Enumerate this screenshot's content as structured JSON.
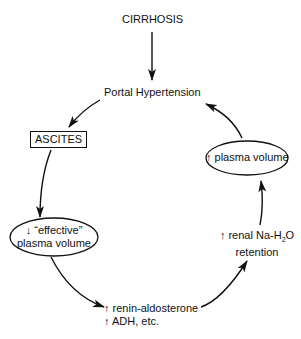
{
  "diagram": {
    "top": {
      "label": "CIRRHOSIS"
    },
    "nodes": {
      "portal_hypertension": "Portal Hypertension",
      "ascites": "ASCITES",
      "effective_plasma_volume": {
        "line1": "↓ “effective”",
        "line2": "plasma volume"
      },
      "renin": {
        "line1": "↑ renin-aldosterone",
        "line2": "↑ ADH, etc."
      },
      "renal_retention": {
        "line1_prefix": "↑ renal Na-H",
        "line1_sub": "2",
        "line1_suffix": "O",
        "line2": "retention"
      },
      "plasma_volume_up": "↑ plasma volume"
    },
    "edges": [
      {
        "from": "CIRRHOSIS",
        "to": "Portal Hypertension"
      },
      {
        "from": "Portal Hypertension",
        "to": "ASCITES"
      },
      {
        "from": "ASCITES",
        "to": "↓ effective plasma volume"
      },
      {
        "from": "↓ effective plasma volume",
        "to": "↑ renin-aldosterone / ↑ ADH, etc."
      },
      {
        "from": "↑ renin-aldosterone / ↑ ADH, etc.",
        "to": "↑ renal Na-H2O retention"
      },
      {
        "from": "↑ renal Na-H2O retention",
        "to": "↑ plasma volume"
      },
      {
        "from": "↑ plasma volume",
        "to": "Portal Hypertension"
      }
    ],
    "colors": {
      "ink": "#111111",
      "background": "#ffffff"
    }
  }
}
